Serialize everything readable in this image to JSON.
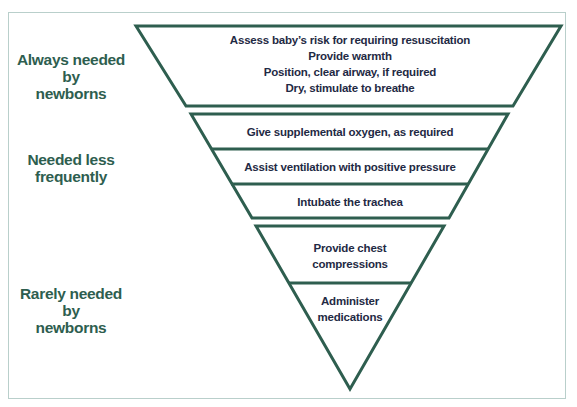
{
  "diagram": {
    "type": "inverted-pyramid",
    "colors": {
      "outline": "#2e5e4f",
      "label": "#2e5e4f",
      "step_text": "#1f2a44",
      "frame_border": "#b9cfcb"
    },
    "tiers": [
      {
        "label_lines": [
          "Always needed by",
          "newborns"
        ],
        "steps": [
          {
            "lines": [
              "Assess baby’s risk for requiring resuscitation",
              "Provide warmth",
              "Position, clear airway, if required",
              "Dry, stimulate to breathe"
            ]
          }
        ]
      },
      {
        "label_lines": [
          "Needed less",
          "frequently"
        ],
        "steps": [
          {
            "lines": [
              "Give supplemental oxygen, as required"
            ]
          },
          {
            "lines": [
              "Assist ventilation with positive pressure"
            ]
          },
          {
            "lines": [
              "Intubate the trachea"
            ]
          }
        ]
      },
      {
        "label_lines": [
          "Rarely needed by",
          "newborns"
        ],
        "steps": [
          {
            "lines": [
              "Provide chest",
              "compressions"
            ]
          },
          {
            "lines": [
              "Administer",
              "medications"
            ]
          }
        ]
      }
    ]
  }
}
